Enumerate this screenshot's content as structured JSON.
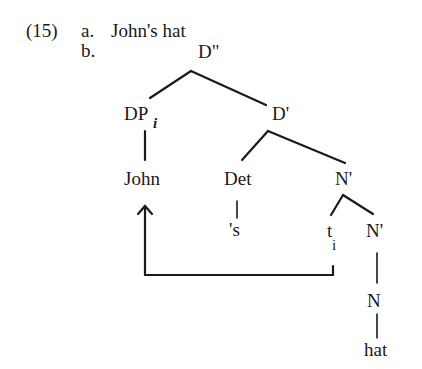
{
  "example": {
    "number": "(15)",
    "item_a": {
      "label": "a.",
      "text": "John's hat"
    },
    "item_b": {
      "label": "b."
    }
  },
  "tree": {
    "root": "D\"",
    "specifier": "DP",
    "specifier_index": "i",
    "d_bar": "D'",
    "john": "John",
    "det": "Det",
    "possessive": "'s",
    "n_bar_upper": "N'",
    "trace": "t",
    "trace_index": "i",
    "n_bar_lower": "N'",
    "n": "N",
    "hat": "hat"
  },
  "movement": {
    "from": "trace",
    "to": "John",
    "type": "arrow"
  }
}
